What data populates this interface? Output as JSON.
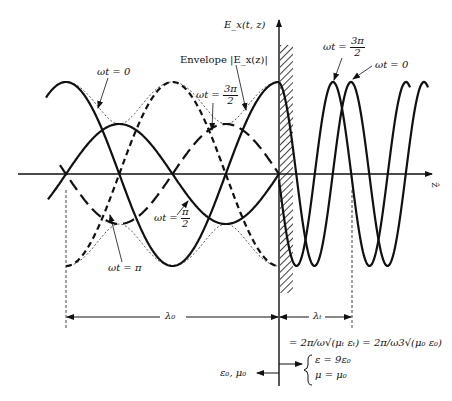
{
  "figure": {
    "axes": {
      "vertical_label": "E_x(t, z)",
      "horizontal_label": "ẑ"
    },
    "labels": {
      "envelope": "Envelope |E_x(z)|",
      "wt0_left": "ωt = 0",
      "wt3pi2_left_prefix": "ωt =",
      "wt3pi2_left_num": "3π",
      "wt3pi2_left_den": "2",
      "wtpi2_prefix": "ωt =",
      "wtpi2_num": "π",
      "wtpi2_den": "2",
      "wtpi": "ωt = π",
      "wt3pi2_right_prefix": "ωt =",
      "wt3pi2_right_num": "3π",
      "wt3pi2_right_den": "2",
      "wt0_right": "ωt = 0"
    },
    "dimensions": {
      "lambda0": "λ₀",
      "lambdat": "λₜ",
      "lambdat_formula": "= 2π/ω√(μₜ εₜ) = 2π/ω3√(μ₀ ε₀)"
    },
    "media": {
      "left": "ε₀, μ₀",
      "right_eps": "ε = 9ε₀",
      "right_mu": "μ = μ₀"
    },
    "geometry": {
      "axis_y": 174,
      "boundary_x": 279,
      "left_lambda_px": 213,
      "left_max_amp": 92,
      "left_min_amp": 50,
      "right_lambda_px": 73,
      "right_amp": 92
    }
  }
}
